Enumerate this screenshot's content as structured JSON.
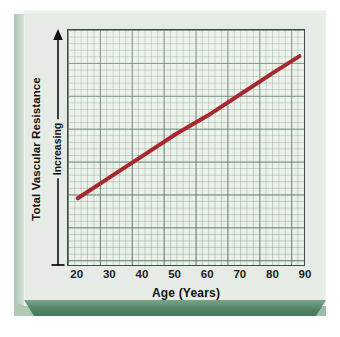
{
  "figure": {
    "background_color": "#e6ece5",
    "card_edge_color": "#4f8264",
    "plot_background": "#e8efe7",
    "line_color": "#a8282f",
    "grid_major_color": "#4e6e58",
    "grid_minor_color": "#789680"
  },
  "axes": {
    "y_title": "Total Vascular Resistance",
    "y_direction_label": "Increasing",
    "y_arrow": "up-arrow",
    "x_title": "Age (Years)",
    "x_ticks": [
      "20",
      "30",
      "40",
      "50",
      "60",
      "70",
      "80",
      "90"
    ]
  },
  "chart_data": {
    "type": "line",
    "title": "",
    "xlabel": "Age (Years)",
    "ylabel": "Total Vascular Resistance (Increasing)",
    "xlim": [
      17,
      90
    ],
    "ylim": [
      0,
      100
    ],
    "grid": true,
    "legend": "none",
    "xticks": [
      20,
      30,
      40,
      50,
      60,
      70,
      80,
      90
    ],
    "yticks": [],
    "series": [
      {
        "name": "Total Vascular Resistance",
        "color": "#a8282f",
        "linewidth": 4,
        "x": [
          20,
          30,
          40,
          50,
          60,
          70,
          80,
          88
        ],
        "y": [
          29,
          38,
          47,
          56,
          64,
          73,
          82,
          89
        ]
      }
    ],
    "annotations": []
  }
}
